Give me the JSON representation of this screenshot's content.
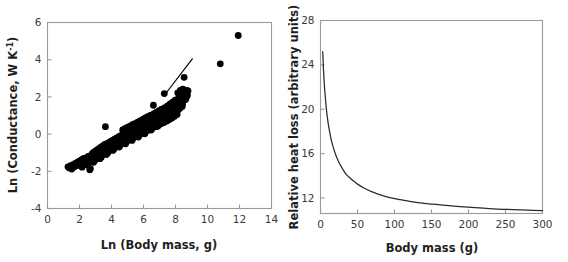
{
  "figure": {
    "panel_count": 2,
    "background_color": "#ffffff",
    "axis_color": "#9a9a9a",
    "data_color": "#000000"
  },
  "chart_data": [
    {
      "id": "panel-left",
      "type": "scatter",
      "title": "",
      "xlabel": "Ln (Body mass, g)",
      "ylabel": "Ln (Conductance, W K",
      "ylabel_superscript": "-1",
      "ylabel_suffix": ")",
      "xlim": [
        0,
        14
      ],
      "ylim": [
        -4,
        6
      ],
      "xticks": [
        0,
        2,
        4,
        6,
        8,
        10,
        12,
        14
      ],
      "yticks": [
        -4,
        -2,
        0,
        2,
        4,
        6
      ],
      "xticklabels": [
        "0",
        "2",
        "4",
        "6",
        "8",
        "10",
        "12",
        "14"
      ],
      "yticklabels": [
        "-4",
        "-2",
        "0",
        "2",
        "4",
        "6"
      ],
      "grid": false,
      "legend": false,
      "marker": "filled-circle",
      "marker_size_px": 4.6,
      "fit_line": {
        "present": true,
        "x_start": 7.45,
        "y_start": 2.25,
        "x_end": 9.05,
        "y_end": 4.05,
        "color": "#000000"
      },
      "points": [
        [
          1.28,
          -1.76
        ],
        [
          1.36,
          -1.82
        ],
        [
          1.45,
          -1.7
        ],
        [
          1.52,
          -1.88
        ],
        [
          1.6,
          -1.64
        ],
        [
          1.68,
          -1.75
        ],
        [
          1.74,
          -1.58
        ],
        [
          1.82,
          -1.7
        ],
        [
          1.9,
          -1.5
        ],
        [
          1.95,
          -1.62
        ],
        [
          2.02,
          -1.44
        ],
        [
          2.08,
          -1.58
        ],
        [
          2.14,
          -1.38
        ],
        [
          2.2,
          -1.52
        ],
        [
          2.26,
          -1.3
        ],
        [
          2.32,
          -1.46
        ],
        [
          2.38,
          -1.55
        ],
        [
          2.44,
          -1.26
        ],
        [
          2.5,
          -1.4
        ],
        [
          2.55,
          -1.2
        ],
        [
          2.6,
          -1.34
        ],
        [
          2.64,
          -1.92
        ],
        [
          2.68,
          -1.86
        ],
        [
          2.72,
          -1.14
        ],
        [
          2.76,
          -1.28
        ],
        [
          2.8,
          -1.05
        ],
        [
          2.84,
          -1.22
        ],
        [
          2.88,
          -0.98
        ],
        [
          2.92,
          -1.16
        ],
        [
          2.96,
          -1.34
        ],
        [
          3.0,
          -0.92
        ],
        [
          3.05,
          -1.08
        ],
        [
          3.1,
          -0.85
        ],
        [
          3.14,
          -1.02
        ],
        [
          3.18,
          -1.2
        ],
        [
          3.22,
          -0.78
        ],
        [
          3.26,
          -0.95
        ],
        [
          3.3,
          -1.12
        ],
        [
          3.34,
          -0.7
        ],
        [
          3.38,
          -0.88
        ],
        [
          3.42,
          -1.05
        ],
        [
          3.46,
          -0.64
        ],
        [
          3.5,
          -0.82
        ],
        [
          3.54,
          -0.98
        ],
        [
          3.58,
          -0.56
        ],
        [
          3.62,
          0.4
        ],
        [
          3.66,
          -0.75
        ],
        [
          3.7,
          -0.92
        ],
        [
          3.74,
          -0.5
        ],
        [
          3.78,
          -0.68
        ],
        [
          3.82,
          -0.85
        ],
        [
          3.86,
          -0.44
        ],
        [
          3.9,
          -0.62
        ],
        [
          3.94,
          -0.78
        ],
        [
          3.98,
          -0.38
        ],
        [
          4.02,
          -0.56
        ],
        [
          4.06,
          -0.72
        ],
        [
          4.1,
          -0.32
        ],
        [
          4.14,
          -0.5
        ],
        [
          4.18,
          -0.66
        ],
        [
          4.22,
          -0.26
        ],
        [
          4.26,
          -0.44
        ],
        [
          4.3,
          -0.6
        ],
        [
          4.34,
          -0.2
        ],
        [
          4.38,
          -0.38
        ],
        [
          4.42,
          -0.54
        ],
        [
          4.46,
          -0.14
        ],
        [
          4.5,
          -0.32
        ],
        [
          4.54,
          -0.48
        ],
        [
          4.58,
          -0.08
        ],
        [
          4.62,
          -0.26
        ],
        [
          4.66,
          -0.42
        ],
        [
          4.7,
          0.22
        ],
        [
          4.74,
          -0.02
        ],
        [
          4.78,
          -0.2
        ],
        [
          4.82,
          -0.36
        ],
        [
          4.86,
          0.3
        ],
        [
          4.9,
          0.05
        ],
        [
          4.94,
          -0.14
        ],
        [
          4.98,
          -0.3
        ],
        [
          5.02,
          0.38
        ],
        [
          5.06,
          0.12
        ],
        [
          5.1,
          -0.08
        ],
        [
          5.14,
          -0.24
        ],
        [
          5.18,
          0.44
        ],
        [
          5.22,
          0.18
        ],
        [
          5.26,
          -0.02
        ],
        [
          5.3,
          -0.18
        ],
        [
          5.34,
          0.52
        ],
        [
          5.38,
          0.25
        ],
        [
          5.42,
          0.05
        ],
        [
          5.46,
          -0.12
        ],
        [
          5.5,
          0.58
        ],
        [
          5.54,
          0.32
        ],
        [
          5.58,
          0.12
        ],
        [
          5.62,
          -0.06
        ],
        [
          5.66,
          0.65
        ],
        [
          5.7,
          0.38
        ],
        [
          5.74,
          0.18
        ],
        [
          5.78,
          0.0
        ],
        [
          5.82,
          0.72
        ],
        [
          5.86,
          0.45
        ],
        [
          5.9,
          0.25
        ],
        [
          5.94,
          0.06
        ],
        [
          5.98,
          0.8
        ],
        [
          6.02,
          0.52
        ],
        [
          6.06,
          0.32
        ],
        [
          6.1,
          0.12
        ],
        [
          6.14,
          0.88
        ],
        [
          6.18,
          0.6
        ],
        [
          6.22,
          0.4
        ],
        [
          6.26,
          0.2
        ],
        [
          6.3,
          0.95
        ],
        [
          6.34,
          0.68
        ],
        [
          6.38,
          0.46
        ],
        [
          6.42,
          0.26
        ],
        [
          6.46,
          1.02
        ],
        [
          6.5,
          0.75
        ],
        [
          6.54,
          0.54
        ],
        [
          6.58,
          0.34
        ],
        [
          6.62,
          1.55
        ],
        [
          6.66,
          1.1
        ],
        [
          6.7,
          0.82
        ],
        [
          6.74,
          0.6
        ],
        [
          6.78,
          0.4
        ],
        [
          6.82,
          1.18
        ],
        [
          6.86,
          0.9
        ],
        [
          6.9,
          0.68
        ],
        [
          6.94,
          0.48
        ],
        [
          6.98,
          1.26
        ],
        [
          7.02,
          0.98
        ],
        [
          7.06,
          0.76
        ],
        [
          7.1,
          0.55
        ],
        [
          7.14,
          1.34
        ],
        [
          7.18,
          1.06
        ],
        [
          7.22,
          0.84
        ],
        [
          7.26,
          0.62
        ],
        [
          7.3,
          2.18
        ],
        [
          7.34,
          1.42
        ],
        [
          7.38,
          1.14
        ],
        [
          7.42,
          0.92
        ],
        [
          7.46,
          0.7
        ],
        [
          7.5,
          1.52
        ],
        [
          7.54,
          1.22
        ],
        [
          7.58,
          1.0
        ],
        [
          7.62,
          0.78
        ],
        [
          7.66,
          1.62
        ],
        [
          7.7,
          1.32
        ],
        [
          7.74,
          1.08
        ],
        [
          7.78,
          0.86
        ],
        [
          7.82,
          1.72
        ],
        [
          7.86,
          1.42
        ],
        [
          7.9,
          1.18
        ],
        [
          7.94,
          0.96
        ],
        [
          7.98,
          1.82
        ],
        [
          8.02,
          1.52
        ],
        [
          8.06,
          1.28
        ],
        [
          8.1,
          1.05
        ],
        [
          8.14,
          2.22
        ],
        [
          8.18,
          1.92
        ],
        [
          8.22,
          1.62
        ],
        [
          8.26,
          1.38
        ],
        [
          8.3,
          2.35
        ],
        [
          8.34,
          2.05
        ],
        [
          8.38,
          1.75
        ],
        [
          8.42,
          1.48
        ],
        [
          8.46,
          2.42
        ],
        [
          8.5,
          2.12
        ],
        [
          8.54,
          3.05
        ],
        [
          8.58,
          1.85
        ],
        [
          8.62,
          2.28
        ],
        [
          8.66,
          1.98
        ],
        [
          8.7,
          2.35
        ],
        [
          8.74,
          2.1
        ],
        [
          8.78,
          2.32
        ],
        [
          10.8,
          3.78
        ],
        [
          11.92,
          5.3
        ],
        [
          2.48,
          -1.66
        ],
        [
          2.88,
          -1.52
        ],
        [
          3.28,
          -1.32
        ],
        [
          3.68,
          -1.1
        ],
        [
          4.08,
          -0.88
        ],
        [
          4.48,
          -0.7
        ],
        [
          4.88,
          -0.52
        ],
        [
          5.28,
          -0.34
        ],
        [
          5.68,
          -0.16
        ],
        [
          6.08,
          0.02
        ],
        [
          6.48,
          0.22
        ],
        [
          6.88,
          0.42
        ],
        [
          7.28,
          0.64
        ],
        [
          7.68,
          0.88
        ],
        [
          8.08,
          1.12
        ],
        [
          2.16,
          -1.78
        ],
        [
          2.56,
          -1.56
        ],
        [
          2.96,
          -1.42
        ],
        [
          3.36,
          -1.24
        ],
        [
          3.76,
          -1.02
        ],
        [
          4.16,
          -0.8
        ],
        [
          4.56,
          -0.58
        ],
        [
          4.96,
          -0.4
        ],
        [
          5.36,
          -0.22
        ],
        [
          5.76,
          -0.04
        ],
        [
          6.16,
          0.15
        ],
        [
          6.56,
          0.36
        ],
        [
          6.96,
          0.58
        ],
        [
          7.36,
          0.8
        ],
        [
          7.76,
          1.04
        ],
        [
          8.16,
          1.3
        ],
        [
          8.44,
          1.6
        ],
        [
          8.64,
          1.88
        ],
        [
          8.72,
          2.05
        ]
      ]
    },
    {
      "id": "panel-right",
      "type": "line",
      "title": "",
      "xlabel": "Body mass (g)",
      "ylabel": "Relative heat loss (arbitrary units)",
      "xlim": [
        0,
        300
      ],
      "ylim": [
        10.6,
        28
      ],
      "xticks": [
        0,
        50,
        100,
        150,
        200,
        250,
        300
      ],
      "yticks": [
        12,
        16,
        20,
        24,
        28
      ],
      "xticklabels": [
        "0",
        "50",
        "100",
        "150",
        "200",
        "250",
        "300"
      ],
      "yticklabels": [
        "12",
        "16",
        "20",
        "24",
        "28"
      ],
      "grid": false,
      "legend": false,
      "relation": "power-law decay, proportional to mass^(-1/3)",
      "x": [
        3,
        4,
        5,
        6,
        8,
        10,
        12,
        15,
        18,
        21,
        25,
        30,
        35,
        40,
        45,
        50,
        60,
        70,
        80,
        90,
        100,
        110,
        125,
        140,
        150,
        165,
        180,
        200,
        220,
        240,
        260,
        280,
        300
      ],
      "y": [
        25.2,
        23.6,
        22.4,
        21.5,
        20.0,
        18.9,
        18.1,
        17.1,
        16.4,
        15.8,
        15.2,
        14.6,
        14.1,
        13.8,
        13.5,
        13.25,
        12.85,
        12.55,
        12.3,
        12.1,
        11.95,
        11.82,
        11.65,
        11.52,
        11.45,
        11.35,
        11.27,
        11.17,
        11.08,
        11.0,
        10.95,
        10.9,
        10.85
      ]
    }
  ]
}
